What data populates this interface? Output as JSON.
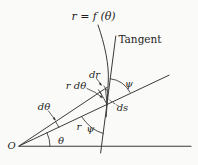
{
  "diagram": {
    "title": "r = f (θ)",
    "labels": {
      "tangent": "Tangent",
      "dr": "dr",
      "r_dtheta": "r dθ",
      "dtheta": "dθ",
      "ds": "ds",
      "radius": "r",
      "psi_upper": "ψ",
      "psi_lower": "ψ",
      "theta": "θ",
      "origin": "O"
    },
    "colors": {
      "line": "#3a3a3a",
      "text": "#1f1f1f",
      "background": "#fafaf8"
    }
  }
}
